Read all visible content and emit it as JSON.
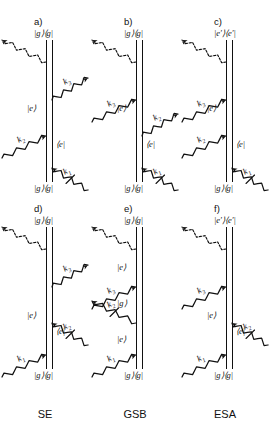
{
  "figure": {
    "type": "double-sided-feynman-diagrams",
    "width": 271,
    "height": 433,
    "background": "#ffffff",
    "ink": "#111111"
  },
  "columns": [
    {
      "id": "SE",
      "name": "SE",
      "x": 0
    },
    {
      "id": "GSB",
      "name": "GSB",
      "x": 90
    },
    {
      "id": "ESA",
      "name": "ESA",
      "x": 180
    }
  ],
  "glyphs": {
    "ket_g": "|g⟩",
    "bra_g": "⟨g|",
    "ket_e": "|e⟩",
    "bra_e": "⟨e|",
    "ket_ep": "|e′⟩",
    "bra_ep": "⟨e′|",
    "pop_gg": "|g⟩⟨g|",
    "pop_ee": "|e⟩⟨e|",
    "pop_epep": "|e′⟩⟨e′|",
    "k1": "k",
    "k2": "k",
    "k3": "k",
    "k1_sub": "1",
    "k2_sub": "2",
    "k3_sub": "3"
  },
  "panels": [
    {
      "id": "a",
      "label": "a)",
      "column": "SE",
      "row": "top",
      "pathway": "SE",
      "top_state": "|g⟩⟨g|",
      "bottom_state": "|g⟩⟨g|",
      "left_states": [
        "|e⟩"
      ],
      "right_states": [
        "⟨e|"
      ],
      "interactions": [
        {
          "name": "k1",
          "label": "k",
          "sub": "1",
          "side": "right",
          "direction": "inward",
          "order": 1,
          "slashed": true
        },
        {
          "name": "k2",
          "label": "k",
          "sub": "2",
          "side": "left",
          "direction": "inward",
          "order": 2,
          "slashed": false
        },
        {
          "name": "k3",
          "label": "k",
          "sub": "3",
          "side": "right",
          "direction": "outward",
          "order": 3,
          "slashed": false
        },
        {
          "name": "emission",
          "label": "",
          "sub": "",
          "side": "left",
          "direction": "outward",
          "order": 4,
          "dashed": true
        }
      ]
    },
    {
      "id": "b",
      "label": "b)",
      "column": "GSB",
      "row": "top",
      "pathway": "GSB",
      "top_state": "|g⟩⟨g|",
      "bottom_state": "|g⟩⟨g|",
      "left_states": [
        "|e⟩"
      ],
      "right_states": [
        "⟨e|"
      ],
      "interactions": [
        {
          "name": "k1",
          "label": "k",
          "sub": "1",
          "side": "right",
          "direction": "inward",
          "order": 1,
          "slashed": true
        },
        {
          "name": "k2",
          "label": "k",
          "sub": "2",
          "side": "right",
          "direction": "outward",
          "order": 2,
          "slashed": false
        },
        {
          "name": "k3",
          "label": "k",
          "sub": "3",
          "side": "left",
          "direction": "inward",
          "order": 3,
          "slashed": false
        },
        {
          "name": "emission",
          "label": "",
          "sub": "",
          "side": "left",
          "direction": "outward",
          "order": 4,
          "dashed": true
        }
      ]
    },
    {
      "id": "c",
      "label": "c)",
      "column": "ESA",
      "row": "top",
      "pathway": "ESA",
      "top_state": "|e′⟩⟨e′|",
      "bottom_state": "|g⟩⟨g|",
      "left_states": [
        "|e⟩"
      ],
      "right_states": [
        "⟨e|"
      ],
      "interactions": [
        {
          "name": "k1",
          "label": "k",
          "sub": "1",
          "side": "right",
          "direction": "inward",
          "order": 1,
          "slashed": true
        },
        {
          "name": "k2",
          "label": "k",
          "sub": "2",
          "side": "left",
          "direction": "inward",
          "order": 2,
          "slashed": false
        },
        {
          "name": "k3",
          "label": "k",
          "sub": "3",
          "side": "left",
          "direction": "inward",
          "order": 3,
          "slashed": false
        },
        {
          "name": "emission",
          "label": "",
          "sub": "",
          "side": "left",
          "direction": "outward",
          "order": 4,
          "dashed": true
        }
      ]
    },
    {
      "id": "d",
      "label": "d)",
      "column": "SE",
      "row": "bottom",
      "pathway": "SE",
      "top_state": "|g⟩⟨g|",
      "bottom_state": "|g⟩⟨g|",
      "left_states": [
        "|e⟩"
      ],
      "right_states": [
        "⟨e|"
      ],
      "interactions": [
        {
          "name": "k1",
          "label": "k",
          "sub": "1",
          "side": "left",
          "direction": "inward",
          "order": 1,
          "slashed": false
        },
        {
          "name": "k2",
          "label": "k",
          "sub": "2",
          "side": "right",
          "direction": "inward",
          "order": 2,
          "slashed": true
        },
        {
          "name": "k3",
          "label": "k",
          "sub": "3",
          "side": "right",
          "direction": "outward",
          "order": 3,
          "slashed": false
        },
        {
          "name": "emission",
          "label": "",
          "sub": "",
          "side": "left",
          "direction": "outward",
          "order": 4,
          "dashed": true
        }
      ]
    },
    {
      "id": "e",
      "label": "e)",
      "column": "GSB",
      "row": "bottom",
      "pathway": "GSB",
      "top_state": "|g⟩⟨g|",
      "bottom_state": "|g⟩⟨g|",
      "left_states": [
        "|e⟩",
        "|g⟩",
        "|e⟩"
      ],
      "right_states": [],
      "interactions": [
        {
          "name": "k1",
          "label": "k",
          "sub": "1",
          "side": "left",
          "direction": "inward",
          "order": 1,
          "slashed": false
        },
        {
          "name": "k2",
          "label": "k",
          "sub": "2",
          "side": "left",
          "direction": "outward",
          "order": 2,
          "slashed": true
        },
        {
          "name": "k3",
          "label": "k",
          "sub": "3",
          "side": "left",
          "direction": "inward",
          "order": 3,
          "slashed": false
        },
        {
          "name": "emission",
          "label": "",
          "sub": "",
          "side": "left",
          "direction": "outward",
          "order": 4,
          "dashed": true
        }
      ]
    },
    {
      "id": "f",
      "label": "f)",
      "column": "ESA",
      "row": "bottom",
      "pathway": "ESA",
      "top_state": "|e′⟩⟨e′|",
      "bottom_state": "|g⟩⟨g|",
      "left_states": [
        "|e⟩"
      ],
      "right_states": [
        "⟨e|"
      ],
      "interactions": [
        {
          "name": "k1",
          "label": "k",
          "sub": "1",
          "side": "left",
          "direction": "inward",
          "order": 1,
          "slashed": false
        },
        {
          "name": "k2",
          "label": "k",
          "sub": "2",
          "side": "right",
          "direction": "inward",
          "order": 2,
          "slashed": true
        },
        {
          "name": "k3",
          "label": "k",
          "sub": "3",
          "side": "left",
          "direction": "inward",
          "order": 3,
          "slashed": false
        },
        {
          "name": "emission",
          "label": "",
          "sub": "",
          "side": "left",
          "direction": "outward",
          "order": 4,
          "dashed": true
        }
      ]
    }
  ]
}
